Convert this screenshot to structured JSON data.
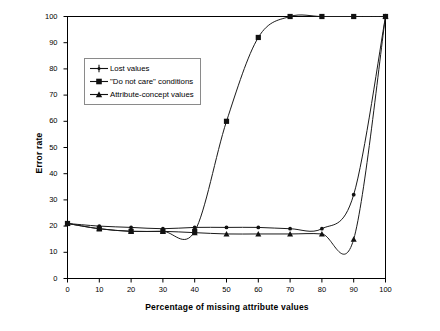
{
  "chart_data": {
    "type": "line",
    "title": "",
    "xlabel": "Percentage of missing attribute values",
    "ylabel": "Error rate",
    "xlim": [
      0,
      100
    ],
    "ylim": [
      0,
      100
    ],
    "xticks": [
      0,
      10,
      20,
      30,
      40,
      50,
      60,
      70,
      80,
      90,
      100
    ],
    "yticks": [
      0,
      10,
      20,
      30,
      40,
      50,
      60,
      70,
      80,
      90,
      100
    ],
    "grid": false,
    "legend_position": "upper-left-inside",
    "x": [
      0,
      10,
      20,
      30,
      40,
      50,
      60,
      70,
      80,
      90,
      100
    ],
    "series": [
      {
        "name": "Lost values",
        "marker": "plus-dot",
        "color": "#1a1a1a",
        "values": [
          21,
          20,
          19.5,
          19,
          19.5,
          19.5,
          19.5,
          19,
          19,
          32,
          100
        ]
      },
      {
        "name": "\"Do not care\" conditions",
        "marker": "square",
        "color": "#1a1a1a",
        "values": [
          21,
          19,
          18,
          18,
          18,
          60,
          92,
          100,
          100,
          100,
          100
        ]
      },
      {
        "name": "Attribute-concept values",
        "marker": "triangle",
        "color": "#1a1a1a",
        "values": [
          21,
          19,
          18,
          18,
          17.5,
          17,
          17,
          17,
          17,
          15,
          100
        ]
      }
    ]
  },
  "axes": {
    "y_title": "Error rate",
    "x_title": "Percentage of missing attribute values",
    "y_tick_labels": [
      "100",
      "90",
      "80",
      "70",
      "60",
      "50",
      "40",
      "30",
      "20",
      "10",
      "0"
    ],
    "x_tick_labels": [
      "0",
      "10",
      "20",
      "30",
      "40",
      "50",
      "60",
      "70",
      "80",
      "90",
      "100"
    ]
  },
  "legend": {
    "items": [
      {
        "label": "Lost values",
        "marker": "plus-dot"
      },
      {
        "label": "\"Do not care\" conditions",
        "marker": "square"
      },
      {
        "label": "Attribute-concept values",
        "marker": "triangle"
      }
    ]
  }
}
